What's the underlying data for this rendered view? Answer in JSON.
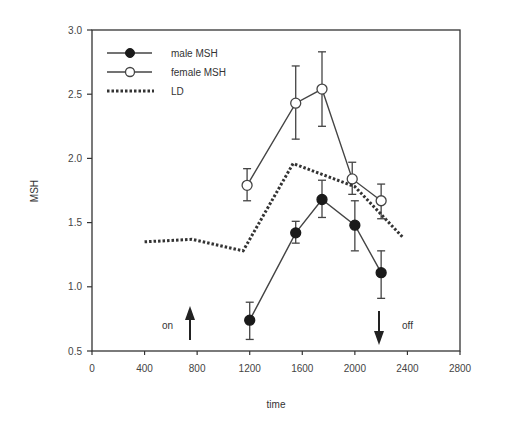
{
  "chart_data": {
    "type": "line",
    "title": "",
    "xlabel": "time",
    "ylabel": "MSH",
    "xlim": [
      0,
      2800
    ],
    "ylim": [
      0.5,
      3.0
    ],
    "x_ticks": [
      "0",
      "400",
      "800",
      "1200",
      "1600",
      "2000",
      "2400",
      "2800"
    ],
    "y_ticks": [
      "0.5",
      "1.0",
      "1.5",
      "2.0",
      "2.5",
      "3.0"
    ],
    "grid": false,
    "legend_position": "upper left",
    "legend": [
      "male MSH",
      "female MSH",
      "LD"
    ],
    "series": [
      {
        "name": "male MSH",
        "marker": "filled-circle",
        "x": [
          1200,
          1550,
          1750,
          2000,
          2200
        ],
        "y": [
          0.74,
          1.42,
          1.68,
          1.48,
          1.11
        ],
        "err_low": [
          0.59,
          1.34,
          1.54,
          1.28,
          0.91
        ],
        "err_high": [
          0.88,
          1.51,
          1.83,
          1.67,
          1.28
        ]
      },
      {
        "name": "female MSH",
        "marker": "open-circle",
        "x": [
          1180,
          1550,
          1750,
          1980,
          2200
        ],
        "y": [
          1.79,
          2.43,
          2.54,
          1.84,
          1.67
        ],
        "err_low": [
          1.67,
          2.15,
          2.25,
          1.72,
          1.53
        ],
        "err_high": [
          1.92,
          2.72,
          2.83,
          1.97,
          1.8
        ]
      },
      {
        "name": "LD",
        "style": "dotted",
        "x": [
          400,
          760,
          1150,
          1530,
          2000,
          2370
        ],
        "y": [
          1.35,
          1.37,
          1.28,
          1.96,
          1.78,
          1.38
        ]
      }
    ],
    "annotations": [
      {
        "text": "on",
        "arrow": "up",
        "x": 680
      },
      {
        "text": "off",
        "arrow": "down",
        "x": 2100
      }
    ]
  },
  "labels": {
    "xlabel": "time",
    "ylabel": "MSH",
    "legend_male": "male MSH",
    "legend_female": "female MSH",
    "legend_ld": "LD",
    "on": "on",
    "off": "off"
  },
  "colors": {
    "axis": "#333333",
    "line": "#444444",
    "marker_fill": "#1a1a1a",
    "open_fill": "#ffffff"
  }
}
